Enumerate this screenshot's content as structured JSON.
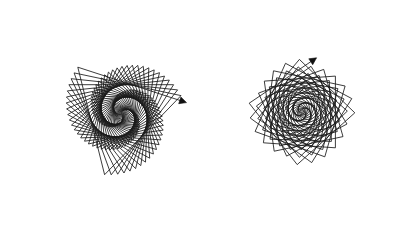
{
  "canvas": {
    "background": "#ffffff",
    "ink_color": "#1a1a1a"
  },
  "drawings": [
    {
      "id": "triangle-polyspiral",
      "description": "Turtle-graphics polyspiral built from near-triangular turns forming a swirling galaxy",
      "turn_degrees": 122,
      "start_length": 1,
      "length_increment": 1.2,
      "steps": 150,
      "turtle_visible": true
    },
    {
      "id": "square-polyspiral",
      "description": "Turtle-graphics polyspiral built from near-square turns forming a rose-like pattern",
      "turn_degrees": 94,
      "start_length": 1,
      "length_increment": 0.95,
      "steps": 165,
      "turtle_visible": true
    }
  ]
}
